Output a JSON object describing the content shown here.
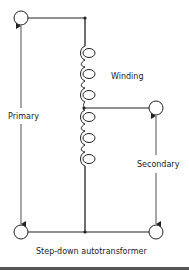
{
  "diagram": {
    "title": "Step-down autotransformer",
    "labels": {
      "winding": "Winding",
      "primary": "Primary",
      "secondary": "Secondary"
    },
    "components": {
      "terminals": [
        "primary-top",
        "secondary-tap",
        "common-bottom-left",
        "common-bottom-right"
      ],
      "winding_turns_upper": 3,
      "winding_turns_lower": 3
    },
    "colors": {
      "line": "#222222",
      "background": "#ffffff"
    }
  }
}
